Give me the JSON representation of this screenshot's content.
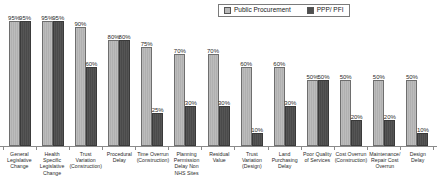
{
  "chart_data": {
    "type": "bar",
    "title": "",
    "xlabel": "",
    "ylabel": "",
    "ylim": [
      0,
      100
    ],
    "grid": false,
    "legend_position": "top-right",
    "categories": [
      "General Legislative Change",
      "Health Specific Legislative Change",
      "Trust Variation (Construction)",
      "Procedural Delay",
      "Time Overrun (Construction)",
      "Planning Permission Delay Non NHS Sites",
      "Residual Value",
      "Trust Variation (Design)",
      "Land Purchasing Delay",
      "Poor Quality of Services",
      "Cost Overrun (Construction)",
      "Maintenance/ Repair Cost Overrun",
      "Design Delay"
    ],
    "series": [
      {
        "name": "Public Procurement",
        "color": "#b8b8b8",
        "values": [
          95,
          95,
          90,
          80,
          75,
          70,
          70,
          60,
          60,
          50,
          50,
          50,
          50
        ],
        "labels": [
          "95%",
          "95%",
          "90%",
          "80%",
          "75%",
          "70%",
          "70%",
          "60%",
          "60%",
          "50%",
          "50%",
          "50%",
          "50%"
        ]
      },
      {
        "name": "PPP/ PFI",
        "color": "#4f4f4f",
        "values": [
          95,
          95,
          60,
          80,
          25,
          30,
          30,
          10,
          30,
          50,
          20,
          20,
          10
        ],
        "labels": [
          "95%",
          "95%",
          "60%",
          "80%",
          "25%",
          "30%",
          "30%",
          "10%",
          "30%",
          "50%",
          "20%",
          "20%",
          "10%"
        ]
      }
    ]
  },
  "legend": {
    "items": [
      {
        "label": "Public Procurement",
        "swatch": "light"
      },
      {
        "label": "PPP/ PFI",
        "swatch": "dark"
      }
    ]
  }
}
